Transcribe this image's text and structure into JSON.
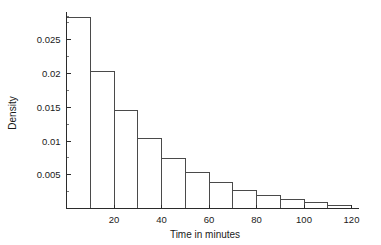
{
  "chart_data": {
    "type": "bar",
    "title": "",
    "subtitle": "",
    "xlabel": "Time in minutes",
    "ylabel": "Density",
    "grid": false,
    "legend": null,
    "xlim": [
      0,
      123
    ],
    "ylim": [
      0,
      0.0295
    ],
    "bin_width": 10,
    "bin_edges": [
      0,
      10,
      20,
      30,
      40,
      50,
      60,
      70,
      80,
      90,
      100,
      110,
      120
    ],
    "categories": [
      "0-10",
      "10-20",
      "20-30",
      "30-40",
      "40-50",
      "50-60",
      "60-70",
      "70-80",
      "80-90",
      "90-100",
      "100-110",
      "110-120"
    ],
    "x": [
      5,
      15,
      25,
      35,
      45,
      55,
      65,
      75,
      85,
      95,
      105,
      115
    ],
    "values": [
      0.0283,
      0.0203,
      0.0145,
      0.0103,
      0.0074,
      0.0053,
      0.0038,
      0.0027,
      0.0019,
      0.0013,
      0.0009,
      0.0005
    ],
    "xticks": [
      0,
      20,
      40,
      60,
      80,
      100,
      120
    ],
    "xtick_labels": [
      "",
      "20",
      "40",
      "60",
      "80",
      "100",
      "120"
    ],
    "xticks_minor": [
      10,
      30,
      50,
      70,
      90,
      110
    ],
    "yticks": [
      0.005,
      0.01,
      0.015,
      0.02,
      0.025
    ],
    "ytick_labels": [
      "0.005",
      "0.01",
      "0.015",
      "0.02",
      "0.025"
    ],
    "yticks_minor": [
      0.0025,
      0.0075,
      0.0125,
      0.0175,
      0.0225,
      0.0275
    ]
  }
}
